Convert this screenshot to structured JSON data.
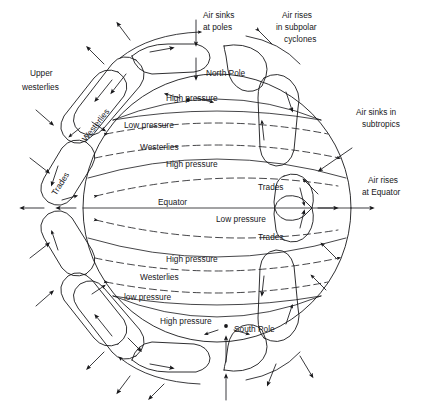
{
  "figure": {
    "background_color": "#ffffff",
    "ink_color": "#17171a"
  },
  "poles": {
    "north": "North Pole",
    "south": "South Pole"
  },
  "equator": {
    "label": "Equator"
  },
  "belts": {
    "north": [
      {
        "id": "n-polar-high",
        "label": "High pressure"
      },
      {
        "id": "n-subpolar-low",
        "label": "Low pressure"
      },
      {
        "id": "n-westerlies",
        "label": "Westerlies"
      },
      {
        "id": "n-subtropical-high",
        "label": "High pressure"
      },
      {
        "id": "n-trades",
        "label": "Trades"
      }
    ],
    "equatorial": [
      {
        "id": "eq-low",
        "label": "Low pressure"
      }
    ],
    "south": [
      {
        "id": "s-trades",
        "label": "Trades"
      },
      {
        "id": "s-subtropical-high",
        "label": "High pressure"
      },
      {
        "id": "s-westerlies",
        "label": "Westerlies"
      },
      {
        "id": "s-subpolar-low",
        "label": "low pressure"
      },
      {
        "id": "s-polar-high",
        "label": "High pressure"
      }
    ]
  },
  "cells": {
    "upper_westerlies": "Upper\nwesterlies",
    "upper_westerlies_line1": "Upper",
    "upper_westerlies_line2": "westerlies",
    "westerlies_cell": "Westerlies",
    "trades_cell": "Trades"
  },
  "annotations": {
    "air_sinks_poles_l1": "Air sinks",
    "air_sinks_poles_l2": "at poles",
    "air_rises_subpolar_l1": "Air rises",
    "air_rises_subpolar_l2": "in subpolar",
    "air_rises_subpolar_l3": "cyclones",
    "air_sinks_subtropics_l1": "Air sinks in",
    "air_sinks_subtropics_l2": "subtropics",
    "air_rises_equator_l1": "Air rises",
    "air_rises_equator_l2": "at Equator"
  }
}
